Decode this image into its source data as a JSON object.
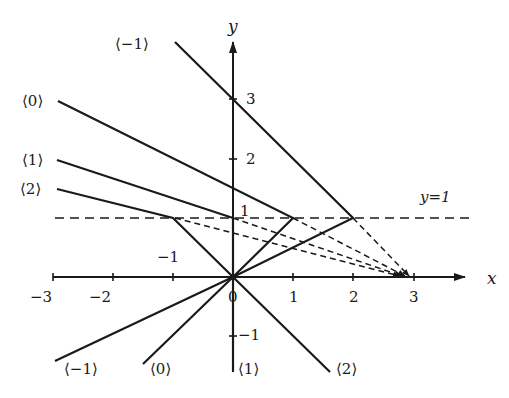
{
  "figure": {
    "axes": {
      "x_label": "x",
      "y_label": "y",
      "x_ticks": [
        {
          "value": -3,
          "label": "−3"
        },
        {
          "value": -2,
          "label": "−2"
        },
        {
          "value": -1,
          "label": "−1"
        },
        {
          "value": 0,
          "label": "0"
        },
        {
          "value": 1,
          "label": "1"
        },
        {
          "value": 2,
          "label": "2"
        },
        {
          "value": 3,
          "label": "3"
        }
      ],
      "y_ticks": [
        {
          "value": 1,
          "label": "1"
        },
        {
          "value": 2,
          "label": "2"
        },
        {
          "value": 3,
          "label": "3"
        },
        {
          "value": -1,
          "label": "−1"
        }
      ]
    },
    "guide_line": {
      "label": "y=1",
      "style": "dashed",
      "y": 1
    },
    "curves": [
      {
        "id": "k-1",
        "label": "⟨−1⟩",
        "bottom_label": "⟨−1⟩",
        "vertex": [
          2,
          1
        ]
      },
      {
        "id": "k0",
        "label": "⟨0⟩",
        "bottom_label": "⟨0⟩",
        "vertex": [
          1,
          1
        ]
      },
      {
        "id": "k1",
        "label": "⟨1⟩",
        "bottom_label": "⟨1⟩",
        "vertex": [
          0,
          1
        ]
      },
      {
        "id": "k2",
        "label": "⟨2⟩",
        "bottom_label": "⟨2⟩",
        "vertex": [
          -1,
          1
        ]
      }
    ],
    "focus_point": [
      3,
      0
    ],
    "colors": {
      "ink": "#1a1a1a",
      "background": "#ffffff"
    }
  }
}
